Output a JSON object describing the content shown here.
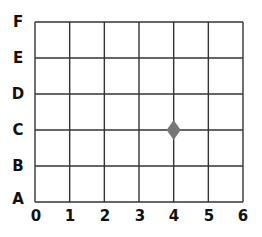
{
  "grid": {
    "x_labels": [
      "0",
      "1",
      "2",
      "3",
      "4",
      "5",
      "6"
    ],
    "y_labels": [
      "A",
      "B",
      "C",
      "D",
      "E",
      "F"
    ],
    "line_color": "#333333"
  },
  "points": [
    {
      "shape": "diamond",
      "x_label": "4",
      "y_label": "C",
      "color": "#777777"
    }
  ]
}
